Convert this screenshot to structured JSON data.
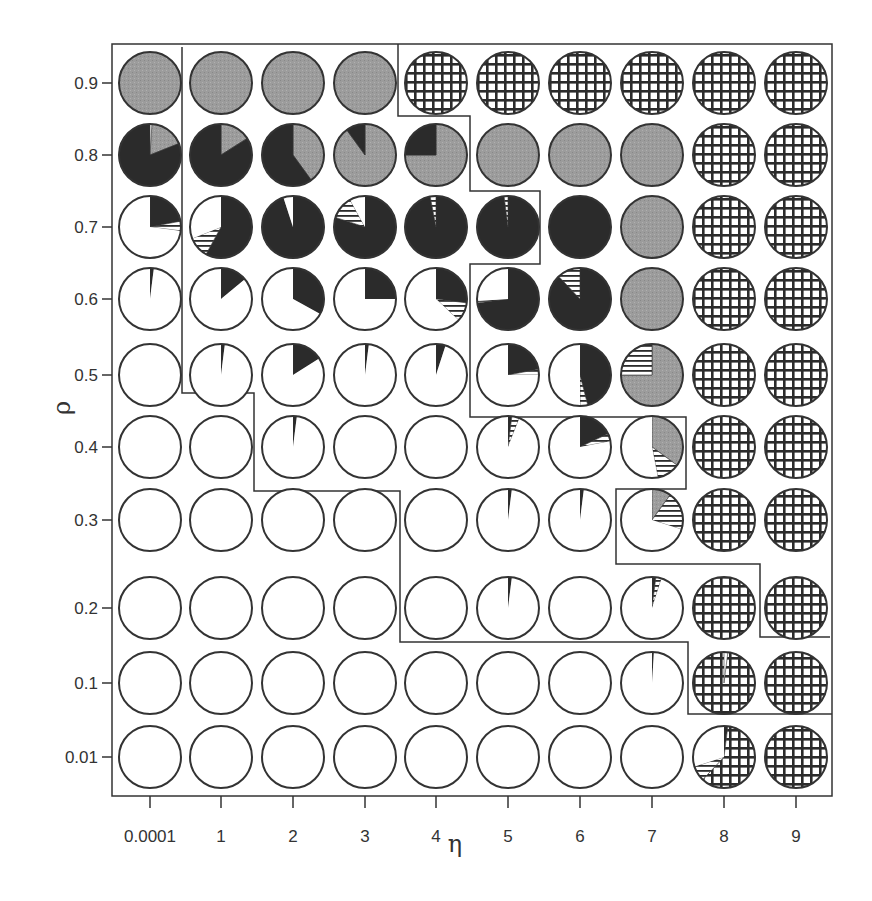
{
  "chart_data": {
    "type": "pie-grid",
    "title": "",
    "xlabel": "η",
    "ylabel": "ρ",
    "x_ticks": [
      "0.0001",
      "1",
      "2",
      "3",
      "4",
      "5",
      "6",
      "7",
      "8",
      "9"
    ],
    "y_ticks": [
      "0.9",
      "0.8",
      "0.7",
      "0.6",
      "0.5",
      "0.4",
      "0.3",
      "0.2",
      "0.1",
      "0.01"
    ],
    "fill_legend": {
      "black": "solid dark fill",
      "gray": "gray stippled fill",
      "hstripe": "horizontal stripes",
      "white": "empty",
      "grid": "crosshatch grid"
    },
    "colors": {
      "black": "#2b2b2b",
      "gray": "#9a9a9a",
      "stroke": "#333333",
      "white": "#ffffff"
    },
    "grid": false,
    "pies": [
      [
        [
          {
            "f": "gray",
            "v": 1
          }
        ],
        [
          {
            "f": "white",
            "v": 0.01
          },
          {
            "f": "gray",
            "v": 0.18
          },
          {
            "f": "black",
            "v": 0.81
          }
        ],
        [
          {
            "f": "black",
            "v": 0.22
          },
          {
            "f": "hstripe",
            "v": 0.05
          },
          {
            "f": "white",
            "v": 0.73
          }
        ],
        [
          {
            "f": "black",
            "v": 0.02
          },
          {
            "f": "white",
            "v": 0.98
          }
        ],
        [
          {
            "f": "white",
            "v": 1
          }
        ],
        [
          {
            "f": "white",
            "v": 1
          }
        ],
        [
          {
            "f": "white",
            "v": 1
          }
        ],
        [
          {
            "f": "white",
            "v": 1
          }
        ],
        [
          {
            "f": "white",
            "v": 1
          }
        ],
        [
          {
            "f": "white",
            "v": 1
          }
        ]
      ],
      [
        [
          {
            "f": "gray",
            "v": 1
          }
        ],
        [
          {
            "f": "gray",
            "v": 0.16
          },
          {
            "f": "black",
            "v": 0.84
          }
        ],
        [
          {
            "f": "black",
            "v": 0.58
          },
          {
            "f": "hstripe",
            "v": 0.11
          },
          {
            "f": "white",
            "v": 0.31
          }
        ],
        [
          {
            "f": "black",
            "v": 0.14
          },
          {
            "f": "white",
            "v": 0.86
          }
        ],
        [
          {
            "f": "black",
            "v": 0.02
          },
          {
            "f": "white",
            "v": 0.98
          }
        ],
        [
          {
            "f": "white",
            "v": 1
          }
        ],
        [
          {
            "f": "white",
            "v": 1
          }
        ],
        [
          {
            "f": "white",
            "v": 1
          }
        ],
        [
          {
            "f": "white",
            "v": 1
          }
        ],
        [
          {
            "f": "white",
            "v": 1
          }
        ]
      ],
      [
        [
          {
            "f": "gray",
            "v": 1
          }
        ],
        [
          {
            "f": "gray",
            "v": 0.4
          },
          {
            "f": "black",
            "v": 0.6
          }
        ],
        [
          {
            "f": "black",
            "v": 0.95
          },
          {
            "f": "white",
            "v": 0.05
          }
        ],
        [
          {
            "f": "black",
            "v": 0.33
          },
          {
            "f": "white",
            "v": 0.67
          }
        ],
        [
          {
            "f": "black",
            "v": 0.16
          },
          {
            "f": "white",
            "v": 0.84
          }
        ],
        [
          {
            "f": "black",
            "v": 0.02
          },
          {
            "f": "white",
            "v": 0.98
          }
        ],
        [
          {
            "f": "white",
            "v": 1
          }
        ],
        [
          {
            "f": "white",
            "v": 1
          }
        ],
        [
          {
            "f": "white",
            "v": 1
          }
        ],
        [
          {
            "f": "white",
            "v": 1
          }
        ]
      ],
      [
        [
          {
            "f": "gray",
            "v": 1
          }
        ],
        [
          {
            "f": "gray",
            "v": 0.9
          },
          {
            "f": "black",
            "v": 0.1
          }
        ],
        [
          {
            "f": "black",
            "v": 0.8
          },
          {
            "f": "hstripe",
            "v": 0.12
          },
          {
            "f": "white",
            "v": 0.08
          }
        ],
        [
          {
            "f": "black",
            "v": 0.25
          },
          {
            "f": "white",
            "v": 0.75
          }
        ],
        [
          {
            "f": "black",
            "v": 0.02
          },
          {
            "f": "white",
            "v": 0.98
          }
        ],
        [
          {
            "f": "white",
            "v": 1
          }
        ],
        [
          {
            "f": "white",
            "v": 1
          }
        ],
        [
          {
            "f": "white",
            "v": 1
          }
        ],
        [
          {
            "f": "white",
            "v": 1
          }
        ],
        [
          {
            "f": "white",
            "v": 1
          }
        ]
      ],
      [
        [
          {
            "f": "grid",
            "v": 1
          }
        ],
        [
          {
            "f": "gray",
            "v": 0.75
          },
          {
            "f": "black",
            "v": 0.25
          }
        ],
        [
          {
            "f": "black",
            "v": 0.97
          },
          {
            "f": "hstripe",
            "v": 0.03
          }
        ],
        [
          {
            "f": "black",
            "v": 0.27
          },
          {
            "f": "hstripe",
            "v": 0.1
          },
          {
            "f": "white",
            "v": 0.63
          }
        ],
        [
          {
            "f": "black",
            "v": 0.05
          },
          {
            "f": "white",
            "v": 0.95
          }
        ],
        [
          {
            "f": "white",
            "v": 1
          }
        ],
        [
          {
            "f": "white",
            "v": 1
          }
        ],
        [
          {
            "f": "white",
            "v": 1
          }
        ],
        [
          {
            "f": "white",
            "v": 1
          }
        ],
        [
          {
            "f": "white",
            "v": 1
          }
        ]
      ],
      [
        [
          {
            "f": "grid",
            "v": 1
          }
        ],
        [
          {
            "f": "gray",
            "v": 1
          }
        ],
        [
          {
            "f": "black",
            "v": 0.98
          },
          {
            "f": "hstripe",
            "v": 0.02
          }
        ],
        [
          {
            "f": "black",
            "v": 0.73
          },
          {
            "f": "hstripe",
            "v": 0.01
          },
          {
            "f": "white",
            "v": 0.26
          }
        ],
        [
          {
            "f": "black",
            "v": 0.22
          },
          {
            "f": "hstripe",
            "v": 0.03
          },
          {
            "f": "white",
            "v": 0.75
          }
        ],
        [
          {
            "f": "black",
            "v": 0.02
          },
          {
            "f": "hstripe",
            "v": 0.04
          },
          {
            "f": "white",
            "v": 0.94
          }
        ],
        [
          {
            "f": "black",
            "v": 0.02
          },
          {
            "f": "white",
            "v": 0.98
          }
        ],
        [
          {
            "f": "black",
            "v": 0.02
          },
          {
            "f": "white",
            "v": 0.98
          }
        ],
        [
          {
            "f": "white",
            "v": 1
          }
        ],
        [
          {
            "f": "white",
            "v": 1
          }
        ]
      ],
      [
        [
          {
            "f": "grid",
            "v": 1
          }
        ],
        [
          {
            "f": "gray",
            "v": 1
          }
        ],
        [
          {
            "f": "black",
            "v": 1
          }
        ],
        [
          {
            "f": "black",
            "v": 0.88
          },
          {
            "f": "hstripe",
            "v": 0.12
          }
        ],
        [
          {
            "f": "black",
            "v": 0.46
          },
          {
            "f": "hstripe",
            "v": 0.04
          },
          {
            "f": "white",
            "v": 0.5
          }
        ],
        [
          {
            "f": "black",
            "v": 0.18
          },
          {
            "f": "hstripe",
            "v": 0.04
          },
          {
            "f": "white",
            "v": 0.78
          }
        ],
        [
          {
            "f": "black",
            "v": 0.02
          },
          {
            "f": "white",
            "v": 0.98
          }
        ],
        [
          {
            "f": "white",
            "v": 1
          }
        ],
        [
          {
            "f": "white",
            "v": 1
          }
        ],
        [
          {
            "f": "white",
            "v": 1
          }
        ]
      ],
      [
        [
          {
            "f": "grid",
            "v": 1
          }
        ],
        [
          {
            "f": "gray",
            "v": 1
          }
        ],
        [
          {
            "f": "gray",
            "v": 1
          }
        ],
        [
          {
            "f": "gray",
            "v": 1
          }
        ],
        [
          {
            "f": "gray",
            "v": 0.75
          },
          {
            "f": "hstripe",
            "v": 0.25
          }
        ],
        [
          {
            "f": "gray",
            "v": 0.35
          },
          {
            "f": "hstripe",
            "v": 0.12
          },
          {
            "f": "white",
            "v": 0.53
          }
        ],
        [
          {
            "f": "gray",
            "v": 0.1
          },
          {
            "f": "hstripe",
            "v": 0.2
          },
          {
            "f": "white",
            "v": 0.7
          }
        ],
        [
          {
            "f": "black",
            "v": 0.02
          },
          {
            "f": "hstripe",
            "v": 0.03
          },
          {
            "f": "white",
            "v": 0.95
          }
        ],
        [
          {
            "f": "black",
            "v": 0.01
          },
          {
            "f": "white",
            "v": 0.99
          }
        ],
        [
          {
            "f": "white",
            "v": 1
          }
        ]
      ],
      [
        [
          {
            "f": "grid",
            "v": 1
          }
        ],
        [
          {
            "f": "grid",
            "v": 1
          }
        ],
        [
          {
            "f": "grid",
            "v": 1
          }
        ],
        [
          {
            "f": "grid",
            "v": 1
          }
        ],
        [
          {
            "f": "grid",
            "v": 1
          }
        ],
        [
          {
            "f": "grid",
            "v": 1
          }
        ],
        [
          {
            "f": "grid",
            "v": 1
          }
        ],
        [
          {
            "f": "grid",
            "v": 1
          }
        ],
        [
          {
            "f": "white",
            "v": 0.02
          },
          {
            "f": "grid",
            "v": 0.98
          }
        ],
        [
          {
            "f": "black",
            "v": 0.02
          },
          {
            "f": "grid",
            "v": 0.6
          },
          {
            "f": "hstripe",
            "v": 0.08
          },
          {
            "f": "white",
            "v": 0.3
          }
        ]
      ],
      [
        [
          {
            "f": "grid",
            "v": 1
          }
        ],
        [
          {
            "f": "grid",
            "v": 1
          }
        ],
        [
          {
            "f": "grid",
            "v": 1
          }
        ],
        [
          {
            "f": "grid",
            "v": 1
          }
        ],
        [
          {
            "f": "grid",
            "v": 1
          }
        ],
        [
          {
            "f": "grid",
            "v": 1
          }
        ],
        [
          {
            "f": "grid",
            "v": 1
          }
        ],
        [
          {
            "f": "grid",
            "v": 1
          }
        ],
        [
          {
            "f": "grid",
            "v": 1
          }
        ],
        [
          {
            "f": "grid",
            "v": 1
          }
        ]
      ]
    ],
    "region_boundaries": [
      {
        "name": "region-low-eta-boundary",
        "points": [
          [
            182,
            47
          ],
          [
            182,
            393
          ],
          [
            254,
            393
          ],
          [
            254,
            491
          ],
          [
            400,
            491
          ],
          [
            400,
            642
          ],
          [
            688,
            642
          ],
          [
            688,
            714
          ],
          [
            832,
            714
          ]
        ]
      },
      {
        "name": "region-high-eta-boundary",
        "points": [
          [
            398,
            44
          ],
          [
            398,
            116
          ],
          [
            470,
            116
          ],
          [
            470,
            191
          ],
          [
            540,
            191
          ],
          [
            540,
            264
          ],
          [
            470,
            264
          ],
          [
            470,
            417
          ],
          [
            686,
            417
          ],
          [
            686,
            489
          ],
          [
            616,
            489
          ],
          [
            616,
            564
          ],
          [
            760,
            564
          ],
          [
            760,
            637
          ],
          [
            830,
            637
          ]
        ]
      }
    ]
  },
  "layout": {
    "frame": {
      "x": 112,
      "y": 44,
      "w": 720,
      "h": 752
    },
    "col_x": [
      150,
      221,
      293,
      365,
      436,
      508,
      580,
      652,
      724,
      796
    ],
    "row_y": [
      83,
      155,
      227,
      299,
      375,
      447,
      520,
      608,
      683,
      757
    ],
    "radius": 31
  }
}
